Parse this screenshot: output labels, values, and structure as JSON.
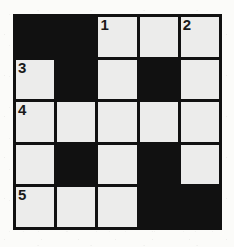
{
  "puzzle": {
    "type": "crossword-grid",
    "rows": 5,
    "columns": 5,
    "colors": {
      "block": "#111111",
      "open_cell": "#ececeb",
      "page_background": "#fbfbfa",
      "number_text": "#1a1a1a"
    },
    "grid": [
      [
        {
          "state": "block",
          "number": ""
        },
        {
          "state": "block",
          "number": ""
        },
        {
          "state": "open",
          "number": "1"
        },
        {
          "state": "open",
          "number": ""
        },
        {
          "state": "open",
          "number": "2"
        }
      ],
      [
        {
          "state": "open",
          "number": "3"
        },
        {
          "state": "block",
          "number": ""
        },
        {
          "state": "open",
          "number": ""
        },
        {
          "state": "block",
          "number": ""
        },
        {
          "state": "open",
          "number": ""
        }
      ],
      [
        {
          "state": "open",
          "number": "4"
        },
        {
          "state": "open",
          "number": ""
        },
        {
          "state": "open",
          "number": ""
        },
        {
          "state": "open",
          "number": ""
        },
        {
          "state": "open",
          "number": ""
        }
      ],
      [
        {
          "state": "open",
          "number": ""
        },
        {
          "state": "block",
          "number": ""
        },
        {
          "state": "open",
          "number": ""
        },
        {
          "state": "block",
          "number": ""
        },
        {
          "state": "open",
          "number": ""
        }
      ],
      [
        {
          "state": "open",
          "number": "5"
        },
        {
          "state": "open",
          "number": ""
        },
        {
          "state": "open",
          "number": ""
        },
        {
          "state": "block",
          "number": ""
        },
        {
          "state": "block",
          "number": ""
        }
      ]
    ],
    "clue_numbers": [
      "1",
      "2",
      "3",
      "4",
      "5"
    ]
  }
}
